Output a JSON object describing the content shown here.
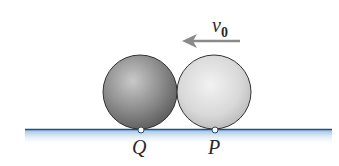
{
  "diagram": {
    "velocity_label": "v",
    "velocity_subscript": "0",
    "arrow_direction": "left",
    "balls": [
      {
        "name": "left-ball",
        "shade": "dark-gray"
      },
      {
        "name": "right-ball",
        "shade": "light-gray"
      }
    ],
    "contact_points": [
      {
        "label": "Q"
      },
      {
        "label": "P"
      }
    ],
    "colors": {
      "ground_line": "#1f4f86",
      "ground_fill": "#a9c8e8",
      "arrow": "#8a8a8a",
      "ball_dark": "#7c7c7c",
      "ball_light": "#d6d6d6",
      "outline": "#333333"
    }
  }
}
